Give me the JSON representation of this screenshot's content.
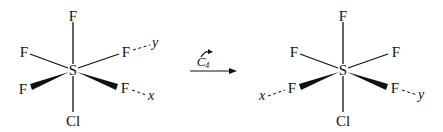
{
  "diagram": {
    "left_molecule": {
      "central_atom": "S",
      "top": "F",
      "bottom": "Cl",
      "upper_left": "F",
      "upper_right": "F",
      "lower_left": "F",
      "lower_right": "F",
      "axis_upper_right": "y",
      "axis_lower_right": "x"
    },
    "operation": {
      "symbol": "C",
      "subscript": "4",
      "arrow": "right-arrow",
      "rotation_icon": "curved-arrow-icon"
    },
    "right_molecule": {
      "central_atom": "S",
      "top": "F",
      "bottom": "Cl",
      "upper_left": "F",
      "upper_right": "F",
      "lower_left": "F",
      "lower_right": "F",
      "axis_lower_left": "x",
      "axis_lower_right": "y"
    },
    "colors": {
      "ink": "#111111",
      "background": "#ffffff"
    }
  }
}
